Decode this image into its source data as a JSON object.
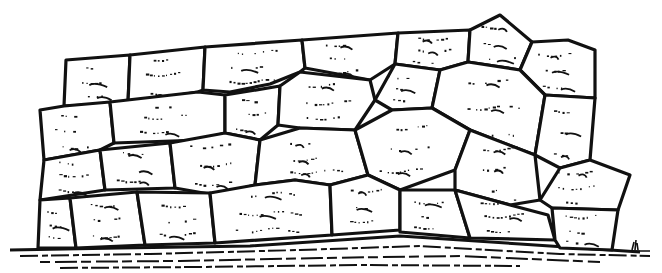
{
  "figure": {
    "subject": "Polygonal masonry wall (line drawing)",
    "ink_color": "#111111",
    "paper_color": "#ffffff",
    "stroke_width": 3.2
  },
  "stones": [
    {
      "id": "r1a",
      "pts": [
        [
          66,
          60
        ],
        [
          130,
          55
        ],
        [
          128,
          103
        ],
        [
          64,
          106
        ]
      ]
    },
    {
      "id": "r1b",
      "pts": [
        [
          130,
          55
        ],
        [
          205,
          47
        ],
        [
          203,
          90
        ],
        [
          198,
          92
        ],
        [
          128,
          103
        ]
      ]
    },
    {
      "id": "r1c",
      "pts": [
        [
          205,
          47
        ],
        [
          302,
          40
        ],
        [
          305,
          68
        ],
        [
          300,
          72
        ],
        [
          270,
          84
        ],
        [
          230,
          92
        ],
        [
          203,
          90
        ]
      ]
    },
    {
      "id": "r1d",
      "pts": [
        [
          302,
          40
        ],
        [
          398,
          33
        ],
        [
          395,
          64
        ],
        [
          370,
          80
        ],
        [
          305,
          68
        ]
      ]
    },
    {
      "id": "r1e",
      "pts": [
        [
          398,
          33
        ],
        [
          470,
          30
        ],
        [
          468,
          62
        ],
        [
          440,
          70
        ],
        [
          395,
          64
        ]
      ]
    },
    {
      "id": "r1f",
      "pts": [
        [
          470,
          30
        ],
        [
          500,
          15
        ],
        [
          532,
          42
        ],
        [
          520,
          70
        ],
        [
          468,
          62
        ]
      ]
    },
    {
      "id": "r1g",
      "pts": [
        [
          532,
          42
        ],
        [
          568,
          40
        ],
        [
          595,
          50
        ],
        [
          595,
          98
        ],
        [
          545,
          95
        ],
        [
          520,
          70
        ]
      ]
    },
    {
      "id": "r2a",
      "pts": [
        [
          40,
          110
        ],
        [
          64,
          106
        ],
        [
          110,
          102
        ],
        [
          114,
          143
        ],
        [
          100,
          150
        ],
        [
          44,
          160
        ]
      ]
    },
    {
      "id": "r2b",
      "pts": [
        [
          110,
          102
        ],
        [
          198,
          92
        ],
        [
          225,
          95
        ],
        [
          225,
          133
        ],
        [
          200,
          140
        ],
        [
          114,
          143
        ]
      ]
    },
    {
      "id": "r2c",
      "pts": [
        [
          225,
          95
        ],
        [
          280,
          86
        ],
        [
          278,
          125
        ],
        [
          260,
          140
        ],
        [
          225,
          133
        ]
      ]
    },
    {
      "id": "r2d",
      "pts": [
        [
          280,
          86
        ],
        [
          300,
          72
        ],
        [
          370,
          80
        ],
        [
          375,
          100
        ],
        [
          355,
          130
        ],
        [
          300,
          128
        ],
        [
          278,
          125
        ]
      ]
    },
    {
      "id": "r2e",
      "pts": [
        [
          375,
          100
        ],
        [
          395,
          64
        ],
        [
          440,
          70
        ],
        [
          432,
          108
        ],
        [
          392,
          110
        ]
      ]
    },
    {
      "id": "r2f",
      "pts": [
        [
          440,
          70
        ],
        [
          468,
          62
        ],
        [
          520,
          70
        ],
        [
          545,
          95
        ],
        [
          535,
          155
        ],
        [
          470,
          130
        ],
        [
          432,
          108
        ]
      ]
    },
    {
      "id": "r2g",
      "pts": [
        [
          545,
          95
        ],
        [
          595,
          98
        ],
        [
          590,
          160
        ],
        [
          560,
          168
        ],
        [
          535,
          155
        ]
      ]
    },
    {
      "id": "r3a",
      "pts": [
        [
          44,
          160
        ],
        [
          100,
          150
        ],
        [
          105,
          190
        ],
        [
          40,
          200
        ]
      ]
    },
    {
      "id": "r3b",
      "pts": [
        [
          100,
          150
        ],
        [
          170,
          143
        ],
        [
          175,
          188
        ],
        [
          105,
          190
        ]
      ]
    },
    {
      "id": "r3c",
      "pts": [
        [
          170,
          143
        ],
        [
          225,
          133
        ],
        [
          260,
          140
        ],
        [
          255,
          185
        ],
        [
          215,
          195
        ],
        [
          175,
          188
        ]
      ]
    },
    {
      "id": "r3d",
      "pts": [
        [
          260,
          140
        ],
        [
          300,
          128
        ],
        [
          355,
          130
        ],
        [
          368,
          175
        ],
        [
          330,
          185
        ],
        [
          295,
          180
        ],
        [
          255,
          185
        ]
      ]
    },
    {
      "id": "r3e",
      "pts": [
        [
          355,
          130
        ],
        [
          392,
          110
        ],
        [
          432,
          108
        ],
        [
          470,
          130
        ],
        [
          455,
          170
        ],
        [
          400,
          190
        ],
        [
          368,
          175
        ]
      ]
    },
    {
      "id": "r3f",
      "pts": [
        [
          470,
          130
        ],
        [
          535,
          155
        ],
        [
          540,
          200
        ],
        [
          510,
          205
        ],
        [
          455,
          190
        ],
        [
          455,
          170
        ]
      ]
    },
    {
      "id": "r3g",
      "pts": [
        [
          560,
          168
        ],
        [
          590,
          160
        ],
        [
          630,
          175
        ],
        [
          618,
          210
        ],
        [
          552,
          208
        ],
        [
          540,
          200
        ]
      ]
    },
    {
      "id": "r4a",
      "pts": [
        [
          40,
          200
        ],
        [
          70,
          198
        ],
        [
          76,
          248
        ],
        [
          38,
          248
        ]
      ]
    },
    {
      "id": "r4b",
      "pts": [
        [
          70,
          198
        ],
        [
          137,
          192
        ],
        [
          145,
          245
        ],
        [
          76,
          248
        ]
      ]
    },
    {
      "id": "r4c",
      "pts": [
        [
          137,
          192
        ],
        [
          210,
          193
        ],
        [
          215,
          243
        ],
        [
          145,
          245
        ]
      ]
    },
    {
      "id": "r4d",
      "pts": [
        [
          210,
          193
        ],
        [
          255,
          185
        ],
        [
          295,
          180
        ],
        [
          330,
          185
        ],
        [
          332,
          235
        ],
        [
          215,
          243
        ]
      ]
    },
    {
      "id": "r4e",
      "pts": [
        [
          330,
          185
        ],
        [
          368,
          175
        ],
        [
          400,
          190
        ],
        [
          400,
          230
        ],
        [
          332,
          235
        ]
      ]
    },
    {
      "id": "r4f",
      "pts": [
        [
          400,
          190
        ],
        [
          455,
          190
        ],
        [
          470,
          238
        ],
        [
          400,
          232
        ]
      ]
    },
    {
      "id": "r4g",
      "pts": [
        [
          455,
          190
        ],
        [
          510,
          205
        ],
        [
          548,
          215
        ],
        [
          555,
          240
        ],
        [
          470,
          238
        ]
      ]
    },
    {
      "id": "r4h",
      "pts": [
        [
          552,
          208
        ],
        [
          618,
          210
        ],
        [
          612,
          250
        ],
        [
          560,
          248
        ],
        [
          555,
          240
        ]
      ]
    }
  ],
  "ground": {
    "lines": [
      [
        [
          10,
          250
        ],
        [
          120,
          248
        ],
        [
          250,
          246
        ],
        [
          400,
          236
        ],
        [
          520,
          244
        ],
        [
          640,
          252
        ]
      ],
      [
        [
          20,
          256
        ],
        [
          150,
          254
        ],
        [
          300,
          250
        ],
        [
          420,
          246
        ],
        [
          560,
          254
        ],
        [
          650,
          256
        ]
      ],
      [
        [
          40,
          262
        ],
        [
          180,
          261
        ],
        [
          320,
          258
        ],
        [
          460,
          256
        ],
        [
          600,
          262
        ]
      ],
      [
        [
          60,
          268
        ],
        [
          200,
          267
        ],
        [
          360,
          265
        ],
        [
          520,
          266
        ]
      ]
    ],
    "tuft": {
      "x": 632,
      "y": 250
    }
  }
}
